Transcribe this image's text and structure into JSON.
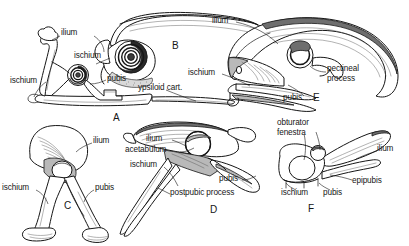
{
  "figure": {
    "background_color": "#ffffff",
    "ink_color": "#161616",
    "shade_color": "#9a9a9a",
    "width": 409,
    "height": 246
  },
  "panels": [
    {
      "id": "A",
      "name": "panel-a",
      "id_position": {
        "x": 113,
        "y": 112
      },
      "labels": [
        {
          "name": "label-ilium",
          "text": "ilium",
          "x": 61,
          "y": 33
        },
        {
          "name": "label-ischium-upper",
          "text": "ischium",
          "x": 74,
          "y": 56
        },
        {
          "name": "label-ischium-left",
          "text": "ischium",
          "x": 12,
          "y": 81
        },
        {
          "name": "label-pubis",
          "text": "pubis",
          "x": 107,
          "y": 79
        },
        {
          "name": "label-ypsiloid-cart",
          "text": "ypsiloid cart.",
          "x": 138,
          "y": 87
        }
      ]
    },
    {
      "id": "B",
      "name": "panel-b",
      "id_position": {
        "x": 172,
        "y": 45
      },
      "labels": []
    },
    {
      "id": "C",
      "name": "panel-c",
      "id_position": {
        "x": 64,
        "y": 203
      },
      "labels": [
        {
          "name": "label-ilium",
          "text": "ilium",
          "x": 93,
          "y": 140
        },
        {
          "name": "label-ischium",
          "text": "ischium",
          "x": 3,
          "y": 187
        },
        {
          "name": "label-pubis",
          "text": "pubis",
          "x": 95,
          "y": 187
        }
      ]
    },
    {
      "id": "D",
      "name": "panel-d",
      "id_position": {
        "x": 210,
        "y": 207
      },
      "labels": [
        {
          "name": "label-ilium",
          "text": "ilium",
          "x": 148,
          "y": 138
        },
        {
          "name": "label-acetabulum",
          "text": "acetabulum",
          "x": 128,
          "y": 149
        },
        {
          "name": "label-ischium",
          "text": "ischium",
          "x": 132,
          "y": 164
        },
        {
          "name": "label-pubis",
          "text": "pubis",
          "x": 219,
          "y": 178
        },
        {
          "name": "label-postpubic-process",
          "text": "postpubic process",
          "x": 172,
          "y": 192
        }
      ]
    },
    {
      "id": "E",
      "name": "panel-e",
      "id_position": {
        "x": 313,
        "y": 96
      },
      "labels": [
        {
          "name": "label-ilium",
          "text": "ilium",
          "x": 212,
          "y": 20
        },
        {
          "name": "label-ischium",
          "text": "ischium",
          "x": 190,
          "y": 72
        },
        {
          "name": "label-pubis",
          "text": "pubis",
          "x": 285,
          "y": 97
        },
        {
          "name": "label-pectineal-process",
          "text": "pectineal\nprocess",
          "x": 327,
          "y": 68
        }
      ]
    },
    {
      "id": "F",
      "name": "panel-f",
      "id_position": {
        "x": 308,
        "y": 206
      },
      "labels": [
        {
          "name": "label-obturator-fenestra",
          "text": "obturator\nfenestra",
          "x": 277,
          "y": 122
        },
        {
          "name": "label-ilium",
          "text": "ilium",
          "x": 379,
          "y": 148
        },
        {
          "name": "label-epipubis",
          "text": "epipubis",
          "x": 354,
          "y": 180
        },
        {
          "name": "label-ischium",
          "text": "ischium",
          "x": 283,
          "y": 192
        },
        {
          "name": "label-pubis",
          "text": "pubis",
          "x": 325,
          "y": 192
        }
      ]
    }
  ]
}
